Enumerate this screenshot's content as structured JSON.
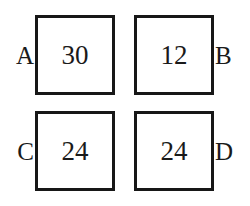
{
  "diagram": {
    "type": "four-box-labeled-grid",
    "background_color": "#ffffff",
    "border_color": "#171717",
    "text_color": "#1a1a1a",
    "cells": [
      {
        "id": "top-left",
        "label": "A",
        "label_side": "left",
        "value": "30"
      },
      {
        "id": "top-right",
        "label": "B",
        "label_side": "right",
        "value": "12"
      },
      {
        "id": "bottom-left",
        "label": "C",
        "label_side": "left",
        "value": "24"
      },
      {
        "id": "bottom-right",
        "label": "D",
        "label_side": "right",
        "value": "24"
      }
    ]
  }
}
